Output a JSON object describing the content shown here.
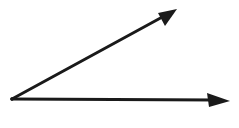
{
  "diagram": {
    "type": "angle",
    "vertex": {
      "x": 12,
      "y": 99
    },
    "rays": [
      {
        "name": "upper-ray",
        "tip": {
          "x": 177,
          "y": 9
        }
      },
      {
        "name": "lower-ray",
        "tip": {
          "x": 230,
          "y": 101
        }
      }
    ],
    "stroke_color": "#1a1a1a",
    "background": "#ffffff"
  }
}
